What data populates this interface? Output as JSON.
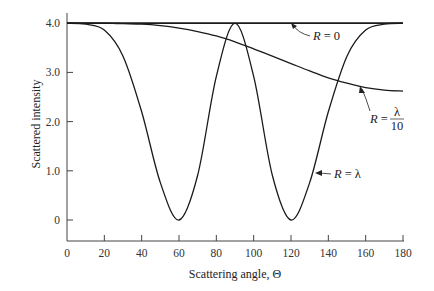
{
  "chart_data": {
    "type": "line",
    "title": "",
    "xlabel": "Scattering angle, Θ",
    "ylabel": "Scattered intensity",
    "xlim": [
      0,
      180
    ],
    "ylim": [
      -0.4,
      4.2
    ],
    "xticks": [
      0,
      20,
      40,
      60,
      80,
      100,
      120,
      140,
      160,
      180
    ],
    "xtick_labels": [
      "0",
      "20",
      "40",
      "60",
      "80",
      "100",
      "120",
      "140",
      "160",
      "180"
    ],
    "yticks": [
      0,
      1.0,
      2.0,
      3.0,
      4.0
    ],
    "ytick_labels": [
      "0",
      "1.0",
      "2.0",
      "3.0",
      "4.0"
    ],
    "grid": false,
    "legend": "none (inline annotations with arrows)",
    "x": [
      0,
      10,
      20,
      30,
      40,
      50,
      60,
      70,
      80,
      90,
      100,
      110,
      120,
      130,
      140,
      150,
      160,
      170,
      180
    ],
    "series": [
      {
        "name": "R = 0",
        "label_parts": {
          "lhs": "R",
          "eq": "=",
          "rhs": "0"
        },
        "values": [
          4.0,
          4.0,
          4.0,
          4.0,
          4.0,
          4.0,
          4.0,
          4.0,
          4.0,
          4.0,
          4.0,
          4.0,
          4.0,
          4.0,
          4.0,
          4.0,
          4.0,
          4.0,
          4.0
        ]
      },
      {
        "name": "R = λ/10",
        "label_parts": {
          "lhs": "R",
          "eq": "=",
          "num": "λ",
          "den": "10"
        },
        "values": [
          4.0,
          4.0,
          4.0,
          3.99,
          3.98,
          3.95,
          3.9,
          3.83,
          3.74,
          3.62,
          3.48,
          3.33,
          3.18,
          3.03,
          2.89,
          2.78,
          2.69,
          2.64,
          2.62
        ]
      },
      {
        "name": "R = λ",
        "label_parts": {
          "lhs": "R",
          "eq": "=",
          "rhs": "λ"
        },
        "values": [
          4.0,
          3.98,
          3.86,
          3.33,
          2.2,
          0.76,
          0.0,
          0.91,
          2.92,
          4.0,
          2.92,
          0.91,
          0.0,
          0.76,
          2.2,
          3.33,
          3.86,
          3.98,
          4.0
        ]
      }
    ],
    "annotations": [
      {
        "text": "R = 0",
        "arrow_to": [
          130,
          4.0
        ]
      },
      {
        "text": "R = λ/10",
        "arrow_to": [
          148,
          2.8
        ]
      },
      {
        "text": "R = λ",
        "arrow_to": [
          132,
          0.95
        ]
      }
    ]
  },
  "colors": {
    "line": "#1a1a1a",
    "axis": "#444444",
    "text": "#222222"
  }
}
